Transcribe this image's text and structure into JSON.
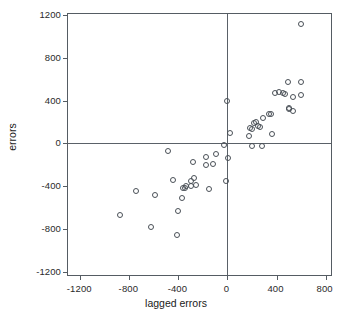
{
  "chart_data": {
    "type": "scatter",
    "title": "",
    "xlabel": "lagged errors",
    "ylabel": "errors",
    "xlim": [
      -1300,
      860
    ],
    "ylim": [
      -1250,
      1210
    ],
    "xticks": [
      -1200,
      -800,
      -400,
      0,
      400,
      800
    ],
    "yticks": [
      -1200,
      -800,
      -400,
      0,
      400,
      800,
      1200
    ],
    "xticklabels": [
      "-1200",
      "-800",
      "-400",
      "0",
      "400",
      "800"
    ],
    "yticklabels": [
      "-1200",
      "-800",
      "-400",
      "0",
      "400",
      "800",
      "1200"
    ],
    "grid": false,
    "legend": false,
    "marker": "open-circle",
    "marker_color": "#4a5057",
    "reference_lines": [
      {
        "name": "zero-horizontal",
        "axis": "y",
        "value": 0
      },
      {
        "name": "zero-vertical",
        "axis": "x",
        "value": 0
      }
    ],
    "series": [
      {
        "name": "errors vs lagged errors",
        "points": [
          [
            600,
            1120
          ],
          [
            490,
            570
          ],
          [
            600,
            570
          ],
          [
            600,
            455
          ],
          [
            450,
            470
          ],
          [
            470,
            465
          ],
          [
            530,
            430
          ],
          [
            420,
            480
          ],
          [
            390,
            470
          ],
          [
            500,
            335
          ],
          [
            530,
            300
          ],
          [
            500,
            320
          ],
          [
            335,
            275
          ],
          [
            355,
            270
          ],
          [
            290,
            240
          ],
          [
            235,
            200
          ],
          [
            215,
            190
          ],
          [
            245,
            160
          ],
          [
            265,
            155
          ],
          [
            185,
            140
          ],
          [
            200,
            130
          ],
          [
            175,
            70
          ],
          [
            360,
            90
          ],
          [
            200,
            -25
          ],
          [
            280,
            -20
          ],
          [
            0,
            400
          ],
          [
            20,
            100
          ],
          [
            -30,
            -15
          ],
          [
            5,
            -140
          ],
          [
            -15,
            -355
          ],
          [
            -90,
            -95
          ],
          [
            -175,
            -130
          ],
          [
            -115,
            -190
          ],
          [
            -175,
            -205
          ],
          [
            -285,
            -170
          ],
          [
            -300,
            -350
          ],
          [
            -275,
            -320
          ],
          [
            -260,
            -390
          ],
          [
            -300,
            -395
          ],
          [
            -340,
            -400
          ],
          [
            -350,
            -420
          ],
          [
            -365,
            -420
          ],
          [
            -150,
            -430
          ],
          [
            -370,
            -510
          ],
          [
            -400,
            -630
          ],
          [
            -445,
            -345
          ],
          [
            -485,
            -75
          ],
          [
            -590,
            -480
          ],
          [
            -620,
            -780
          ],
          [
            -745,
            -445
          ],
          [
            -880,
            -670
          ],
          [
            -415,
            -860
          ]
        ]
      }
    ]
  },
  "axes": {
    "x_title": "lagged errors",
    "y_title": "errors"
  }
}
